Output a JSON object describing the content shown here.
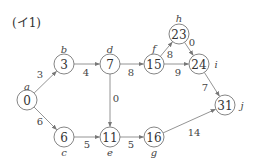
{
  "title": "(イ1)",
  "nodes": [
    {
      "id": "a",
      "value": "0",
      "x": 27,
      "y": 100,
      "lx": 27,
      "ly": 86
    },
    {
      "id": "b",
      "value": "3",
      "x": 64,
      "y": 64,
      "lx": 64,
      "ly": 49
    },
    {
      "id": "c",
      "value": "6",
      "x": 64,
      "y": 137,
      "lx": 64,
      "ly": 152
    },
    {
      "id": "d",
      "value": "7",
      "x": 110,
      "y": 64,
      "lx": 110,
      "ly": 49
    },
    {
      "id": "e",
      "value": "11",
      "x": 110,
      "y": 137,
      "lx": 110,
      "ly": 152
    },
    {
      "id": "f",
      "value": "15",
      "x": 154,
      "y": 64,
      "lx": 154,
      "ly": 48
    },
    {
      "id": "g",
      "value": "16",
      "x": 154,
      "y": 137,
      "lx": 154,
      "ly": 152
    },
    {
      "id": "h",
      "value": "23",
      "x": 179,
      "y": 34,
      "lx": 179,
      "ly": 18
    },
    {
      "id": "i",
      "value": "24",
      "x": 199,
      "y": 64,
      "lx": 216,
      "ly": 64
    },
    {
      "id": "j",
      "value": "31",
      "x": 225,
      "y": 105,
      "lx": 242,
      "ly": 105
    }
  ],
  "edges": [
    {
      "from": "a",
      "to": "b",
      "weight": "3",
      "wx": 40,
      "wy": 74
    },
    {
      "from": "a",
      "to": "c",
      "weight": "6",
      "wx": 40,
      "wy": 121
    },
    {
      "from": "b",
      "to": "d",
      "weight": "4",
      "wx": 86,
      "wy": 72
    },
    {
      "from": "c",
      "to": "e",
      "weight": "5",
      "wx": 87,
      "wy": 144
    },
    {
      "from": "d",
      "to": "f",
      "weight": "8",
      "wx": 131,
      "wy": 72
    },
    {
      "from": "d",
      "to": "e",
      "weight": "0",
      "wx": 116,
      "wy": 98
    },
    {
      "from": "e",
      "to": "g",
      "weight": "5",
      "wx": 131,
      "wy": 144
    },
    {
      "from": "f",
      "to": "h",
      "weight": "8",
      "wx": 170,
      "wy": 54
    },
    {
      "from": "h",
      "to": "i",
      "weight": "0",
      "wx": 192,
      "wy": 42
    },
    {
      "from": "f",
      "to": "i",
      "weight": "9",
      "wx": 178,
      "wy": 72
    },
    {
      "from": "i",
      "to": "j",
      "weight": "7",
      "wx": 205,
      "wy": 87
    },
    {
      "from": "g",
      "to": "j",
      "weight": "14",
      "wx": 194,
      "wy": 132
    }
  ]
}
